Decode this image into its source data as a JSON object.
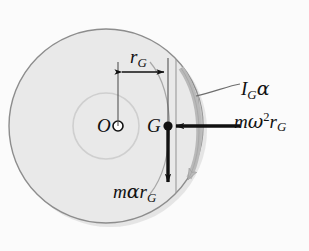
{
  "figure": {
    "background_color": "#fbfbfb"
  },
  "colors": {
    "disk_fill": "#e9e9e9",
    "disk_shade": "#c2c2c2",
    "disk_outline": "#8d8d8d",
    "inner_circle": "#cfcfcf",
    "vector_black": "#111111",
    "moment_gray": "#b9b9b9",
    "leader_gray": "#6e6e6e"
  },
  "geometry": {
    "disk_center_x": 106,
    "disk_center_y": 126,
    "disk_radius": 97,
    "mass_center_x": 168,
    "mass_center_y": 126,
    "pin_radius": 5,
    "inner_circle_radius": 33
  },
  "labels": {
    "pivot": "O",
    "mass_center": "G",
    "radius_dimension": {
      "base": "r",
      "sub": "G"
    },
    "moment": {
      "base": "I",
      "sub": "G",
      "greek": "α"
    },
    "normal_force": {
      "base": "m",
      "greek": "ω",
      "sup": "2",
      "base2": "r",
      "sub": "G"
    },
    "tangential_force": {
      "base": "m",
      "greek": "α",
      "base2": "r",
      "sub": "G"
    }
  },
  "vectors": [
    {
      "name": "normal-inertia-force",
      "label": "mω²r_G",
      "direction": "left",
      "from_x": 240,
      "from_y": 126,
      "to_x": 172,
      "to_y": 126,
      "color": "#111111"
    },
    {
      "name": "tangential-inertia-force",
      "label": "mαr_G",
      "direction": "down",
      "from_x": 168,
      "from_y": 128,
      "to_x": 168,
      "to_y": 188,
      "color": "#111111"
    },
    {
      "name": "inertia-couple",
      "label": "I_Gα",
      "direction": "clockwise",
      "color": "#b9b9b9"
    }
  ],
  "dimension": {
    "name": "rg-dimension",
    "label": "r_G",
    "from_x": 118,
    "from_y": 72,
    "to_x": 168,
    "to_y": 72,
    "extension_top": 60,
    "extension_bottom": 126
  }
}
